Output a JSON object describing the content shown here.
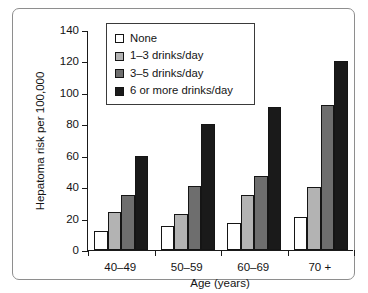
{
  "chart_data": {
    "type": "bar",
    "title": "",
    "xlabel": "Age (years)",
    "ylabel": "Hepatoma risk per 100,000",
    "categories": [
      "40–49",
      "50–59",
      "60–69",
      "70 +"
    ],
    "ylim": [
      0,
      140
    ],
    "yticks": [
      0,
      20,
      40,
      60,
      80,
      100,
      120,
      140
    ],
    "ytick_labels": [
      "0",
      "20",
      "40",
      "60",
      "80",
      "100",
      "120",
      "140"
    ],
    "grid": false,
    "legend_position": "upper-left-inside",
    "series": [
      {
        "name": "None",
        "color": "#ffffff",
        "values": [
          12,
          15,
          17,
          21
        ]
      },
      {
        "name": "1–3 drinks/day",
        "color": "#b3b3b3",
        "values": [
          24,
          23,
          35,
          40
        ]
      },
      {
        "name": "3–5 drinks/day",
        "color": "#6e6e6e",
        "values": [
          35,
          41,
          47,
          92
        ]
      },
      {
        "name": "6 or more drinks/day",
        "color": "#1a1a1a",
        "values": [
          60,
          80,
          91,
          120
        ]
      }
    ]
  },
  "legend": {
    "items": [
      {
        "label": "None",
        "color": "#ffffff"
      },
      {
        "label": "1–3 drinks/day",
        "color": "#b3b3b3"
      },
      {
        "label": "3–5 drinks/day",
        "color": "#6e6e6e"
      },
      {
        "label": "6 or more drinks/day",
        "color": "#1a1a1a"
      }
    ]
  },
  "axes": {
    "y_title": "Hepatoma risk per 100,000",
    "x_title": "Age (years)"
  }
}
